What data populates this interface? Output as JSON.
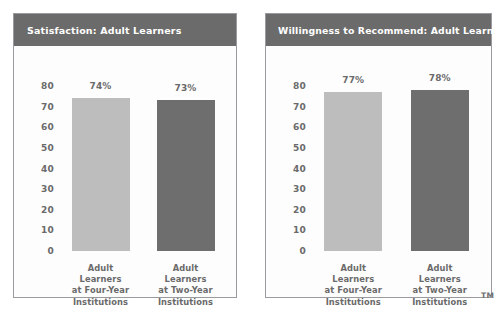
{
  "page": {
    "trademark_mark": "TM",
    "background_color": "#ffffff"
  },
  "style": {
    "header_bg": "#6b6b6b",
    "header_text": "#ffffff",
    "panel_bg": "#fdfdfd",
    "panel_border": "#9a9aa0",
    "axis_text": "#6a6a6a",
    "bar_light": "#bdbdbd",
    "bar_dark": "#6e6e6e"
  },
  "charts": [
    {
      "id": "satisfaction-adult-learners",
      "title": "Satisfaction: Adult Learners",
      "chart_data": {
        "type": "bar",
        "title": "Satisfaction: Adult Learners",
        "xlabel": "",
        "ylabel": "",
        "ylim": [
          0,
          80
        ],
        "yticks": [
          80,
          70,
          60,
          50,
          40,
          30,
          20,
          10,
          0
        ],
        "ytick_labels": [
          "80",
          "70",
          "60",
          "50",
          "40",
          "30",
          "20",
          "10",
          "0"
        ],
        "grid": false,
        "legend": "none",
        "categories": [
          "Adult Learners at Four-Year Institutions",
          "Adult Learners at Two-Year Institutions"
        ],
        "category_lines": [
          [
            "Adult",
            "Learners",
            "at Four-Year",
            "Institutions"
          ],
          [
            "Adult",
            "Learners",
            "at Two-Year",
            "Institutions"
          ]
        ],
        "values": [
          74,
          73
        ],
        "value_labels": [
          "74%",
          "73%"
        ],
        "colors": [
          "#bdbdbd",
          "#6e6e6e"
        ]
      }
    },
    {
      "id": "willingness-to-recommend-adult-learners",
      "title": "Willingness to Recommend: Adult Learners",
      "chart_data": {
        "type": "bar",
        "title": "Willingness to Recommend: Adult Learners",
        "xlabel": "",
        "ylabel": "",
        "ylim": [
          0,
          80
        ],
        "yticks": [
          80,
          70,
          60,
          50,
          40,
          30,
          20,
          10,
          0
        ],
        "ytick_labels": [
          "80",
          "70",
          "60",
          "50",
          "40",
          "30",
          "20",
          "10",
          "0"
        ],
        "grid": false,
        "legend": "none",
        "categories": [
          "Adult Learners at Four-Year Institutions",
          "Adult Learners at Two-Year Institutions"
        ],
        "category_lines": [
          [
            "Adult",
            "Learners",
            "at Four-Year",
            "Institutions"
          ],
          [
            "Adult",
            "Learners",
            "at Two-Year",
            "Institutions"
          ]
        ],
        "values": [
          77,
          78
        ],
        "value_labels": [
          "77%",
          "78%"
        ],
        "colors": [
          "#bdbdbd",
          "#6e6e6e"
        ]
      }
    }
  ]
}
